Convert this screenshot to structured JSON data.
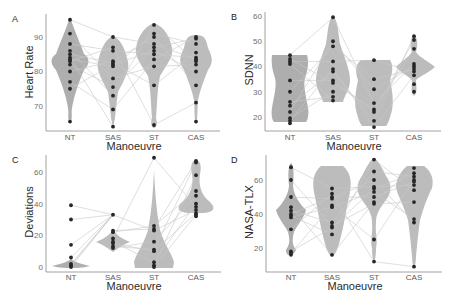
{
  "chart_data": [
    {
      "panel": "A",
      "type": "violin",
      "xlabel": "Manoeuvre",
      "ylabel": "Heart Rate",
      "categories": [
        "NT",
        "SAS",
        "ST",
        "CAS"
      ],
      "yticks": [
        70,
        80,
        90
      ],
      "ylim": [
        63,
        96
      ],
      "grid": false,
      "series": [
        {
          "name": "NT",
          "values": [
            95,
            91,
            88,
            86,
            85,
            84,
            83.5,
            83,
            82,
            80,
            77,
            75,
            65.5
          ]
        },
        {
          "name": "SAS",
          "values": [
            90,
            87,
            86,
            83,
            82.5,
            82,
            81.5,
            78,
            75.5,
            73,
            69,
            64
          ]
        },
        {
          "name": "ST",
          "values": [
            93.5,
            91,
            90,
            88,
            87,
            86,
            85,
            83.5,
            81.5,
            76,
            64.5
          ]
        },
        {
          "name": "CAS",
          "values": [
            90,
            89.5,
            88,
            85.5,
            84,
            83.5,
            83,
            82,
            80,
            76,
            71,
            65.5
          ]
        }
      ]
    },
    {
      "panel": "B",
      "type": "violin",
      "xlabel": "Manoeuvre",
      "ylabel": "SDNN",
      "categories": [
        "NT",
        "SAS",
        "ST",
        "CAS"
      ],
      "yticks": [
        20,
        30,
        40,
        50,
        60
      ],
      "ylim": [
        14,
        61
      ],
      "grid": false,
      "series": [
        {
          "name": "NT",
          "values": [
            44.5,
            43,
            42,
            41,
            34.5,
            30,
            26,
            24.5,
            22,
            19.5,
            18.5,
            17.5
          ]
        },
        {
          "name": "SAS",
          "values": [
            59.5,
            50,
            48,
            42,
            39,
            38,
            34.5,
            33.5,
            30,
            28,
            26.5
          ]
        },
        {
          "name": "ST",
          "values": [
            42.5,
            35,
            31,
            25.5,
            23,
            22,
            18.5,
            16
          ]
        },
        {
          "name": "CAS",
          "values": [
            52,
            50.5,
            47,
            41,
            40,
            39,
            38,
            36.5,
            33,
            30
          ]
        }
      ]
    },
    {
      "panel": "C",
      "type": "violin",
      "xlabel": "Manoeuvre",
      "ylabel": "Deviations",
      "categories": [
        "NT",
        "SAS",
        "ST",
        "CAS"
      ],
      "yticks": [
        0,
        20,
        40,
        60
      ],
      "ylim": [
        -2,
        72
      ],
      "grid": false,
      "series": [
        {
          "name": "NT",
          "values": [
            39,
            30,
            14,
            6,
            2,
            1,
            0
          ]
        },
        {
          "name": "SAS",
          "values": [
            33,
            23,
            22,
            18,
            16,
            15,
            13,
            12
          ]
        },
        {
          "name": "ST",
          "values": [
            69,
            26,
            24,
            23,
            16,
            11,
            10,
            3,
            1,
            0
          ]
        },
        {
          "name": "CAS",
          "values": [
            67,
            66,
            58,
            48,
            45,
            40,
            38,
            36,
            34,
            33,
            32
          ]
        }
      ]
    },
    {
      "panel": "D",
      "type": "violin",
      "xlabel": "Manoeuvre",
      "ylabel": "NASA-TLX",
      "categories": [
        "NT",
        "SAS",
        "ST",
        "CAS"
      ],
      "yticks": [
        20,
        40,
        60
      ],
      "ylim": [
        7,
        74
      ],
      "grid": false,
      "series": [
        {
          "name": "NT",
          "values": [
            67.5,
            60,
            50,
            44,
            42,
            40,
            39,
            38,
            31,
            18,
            17,
            16
          ]
        },
        {
          "name": "SAS",
          "values": [
            55,
            52,
            50,
            49,
            45,
            44,
            35,
            33,
            32,
            28,
            16
          ]
        },
        {
          "name": "ST",
          "values": [
            72,
            65,
            60,
            56,
            55,
            53,
            50,
            47,
            46,
            25,
            12
          ]
        },
        {
          "name": "CAS",
          "values": [
            67,
            64,
            62,
            60,
            59,
            57,
            54,
            47,
            37,
            35,
            9
          ]
        }
      ]
    }
  ],
  "panels": [
    {
      "label": "A",
      "ylabel": "Heart Rate",
      "xlabel": "Manoeuvre",
      "xticks": [
        "NT",
        "SAS",
        "ST",
        "CAS"
      ],
      "yticks": [
        "70",
        "80",
        "90"
      ]
    },
    {
      "label": "B",
      "ylabel": "SDNN",
      "xlabel": "Manoeuvre",
      "xticks": [
        "NT",
        "SAS",
        "ST",
        "CAS"
      ],
      "yticks": [
        "20",
        "30",
        "40",
        "50",
        "60"
      ]
    },
    {
      "label": "C",
      "ylabel": "Deviations",
      "xlabel": "Manoeuvre",
      "xticks": [
        "NT",
        "SAS",
        "ST",
        "CAS"
      ],
      "yticks": [
        "0",
        "20",
        "40",
        "60"
      ]
    },
    {
      "label": "D",
      "ylabel": "NASA-TLX",
      "xlabel": "Manoeuvre",
      "xticks": [
        "NT",
        "SAS",
        "ST",
        "CAS"
      ],
      "yticks": [
        "20",
        "40",
        "60"
      ]
    }
  ],
  "colors": {
    "violin_fill": "#b8b8b8",
    "point": "#262626",
    "pair_line": "#c8c8c8",
    "axis": "#8c8c8c"
  }
}
